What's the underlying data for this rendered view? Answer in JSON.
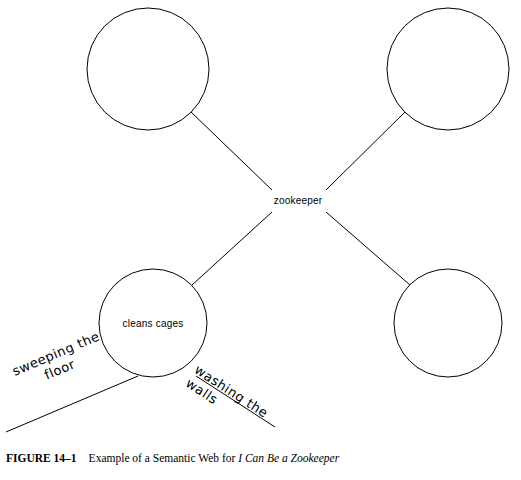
{
  "figure": {
    "number": "FIGURE 14–1",
    "caption_lead": "Example of a Semantic Web for ",
    "caption_title": "I Can Be a Zookeeper"
  },
  "diagram": {
    "type": "semantic-web",
    "center_node": {
      "label": "zookeeper",
      "cx": 298,
      "cy": 200
    },
    "nodes": [
      {
        "name": "top-left-circle",
        "label": "",
        "cx": 148,
        "cy": 69,
        "r": 61
      },
      {
        "name": "top-right-circle",
        "label": "",
        "cx": 448,
        "cy": 69,
        "r": 61
      },
      {
        "name": "bottom-left-circle",
        "label": "cleans cages",
        "cx": 153,
        "cy": 323,
        "r": 54
      },
      {
        "name": "bottom-right-circle",
        "label": "",
        "cx": 448,
        "cy": 323,
        "r": 54
      }
    ],
    "connectors": [
      {
        "name": "connector-top-left",
        "x1": 191,
        "y1": 112,
        "x2": 272,
        "y2": 190
      },
      {
        "name": "connector-top-right",
        "x1": 405,
        "y1": 112,
        "x2": 326,
        "y2": 190
      },
      {
        "name": "connector-bottom-left",
        "x1": 192,
        "y1": 285,
        "x2": 272,
        "y2": 212
      },
      {
        "name": "connector-bottom-right",
        "x1": 410,
        "y1": 285,
        "x2": 326,
        "y2": 212
      }
    ],
    "handwritten_labels": [
      {
        "name": "sweeping-the-floor-label",
        "line1": "sweeping the",
        "line2": "floor"
      },
      {
        "name": "washing-the-walls-label",
        "line1": "washing the",
        "line2": "walls"
      }
    ],
    "rules": [
      {
        "name": "left-underline",
        "x1": 6,
        "y1": 432,
        "x2": 138,
        "y2": 376
      },
      {
        "name": "right-underline",
        "x1": 196,
        "y1": 376,
        "x2": 275,
        "y2": 427
      }
    ],
    "stroke_color": "#000000"
  }
}
